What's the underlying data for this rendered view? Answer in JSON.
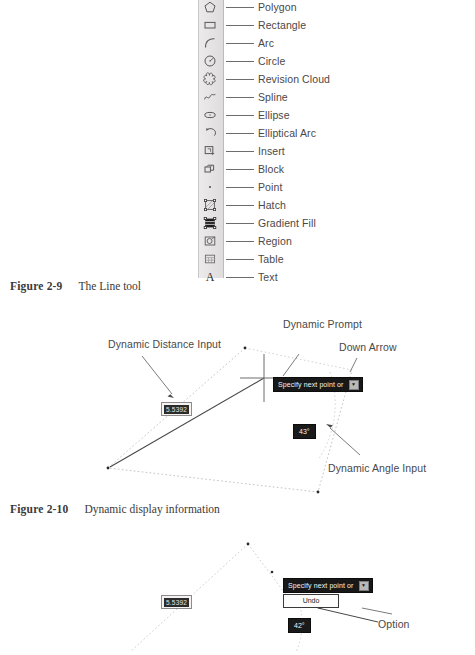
{
  "toolbar": {
    "name": "draw-toolbar",
    "items": [
      {
        "icon": "polygon-icon",
        "label": "Polygon"
      },
      {
        "icon": "rectangle-icon",
        "label": "Rectangle"
      },
      {
        "icon": "arc-icon",
        "label": "Arc"
      },
      {
        "icon": "circle-icon",
        "label": "Circle"
      },
      {
        "icon": "revision-cloud-icon",
        "label": "Revision Cloud"
      },
      {
        "icon": "spline-icon",
        "label": "Spline"
      },
      {
        "icon": "ellipse-icon",
        "label": "Ellipse"
      },
      {
        "icon": "elliptical-arc-icon",
        "label": "Elliptical Arc"
      },
      {
        "icon": "insert-icon",
        "label": "Insert"
      },
      {
        "icon": "block-icon",
        "label": "Block"
      },
      {
        "icon": "point-icon",
        "label": "Point"
      },
      {
        "icon": "hatch-icon",
        "label": "Hatch"
      },
      {
        "icon": "gradient-fill-icon",
        "label": "Gradient Fill"
      },
      {
        "icon": "region-icon",
        "label": "Region"
      },
      {
        "icon": "table-icon",
        "label": "Table"
      },
      {
        "icon": "text-icon",
        "label": "Text"
      }
    ]
  },
  "figures": [
    {
      "number": "Figure 2-9",
      "title": "The Line tool"
    },
    {
      "number": "Figure 2-10",
      "title": "Dynamic display information"
    }
  ],
  "figure_2_10": {
    "annotations": {
      "distance_input": "Dynamic Distance Input",
      "prompt": "Dynamic Prompt",
      "down_arrow": "Down Arrow",
      "angle_input": "Dynamic Angle Input"
    },
    "prompt_text": "Specify next point or",
    "down_arrow_glyph": "▼",
    "distance_value": "5.5392",
    "angle_value": "43°"
  },
  "figure_2_11": {
    "annotations": {
      "option": "Option"
    },
    "prompt_text": "Specify next point or",
    "down_arrow_glyph": "▼",
    "option_label": "Undo",
    "distance_value": "5.5392",
    "angle_value": "42°"
  },
  "colors": {
    "ink": "#231f20",
    "label": "#4a4848",
    "prompt_bg": "#181818",
    "prompt_fg": "#f2f2f2",
    "toolbar_bg": "#e6e4e4"
  }
}
